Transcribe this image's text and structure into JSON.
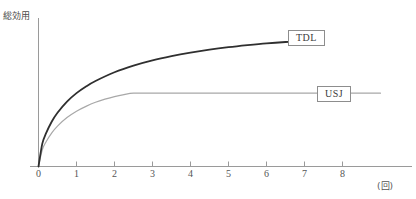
{
  "chart_data": {
    "type": "line",
    "title": "",
    "subtitle": "",
    "xlabel": "(回)",
    "ylabel": "総効用",
    "xlim": [
      -0.35,
      9.2
    ],
    "ylim": [
      0,
      1.12
    ],
    "grid": false,
    "legend_position": "inline-right",
    "x_ticks": [
      "0",
      "1",
      "2",
      "3",
      "4",
      "5",
      "6",
      "7",
      "8"
    ],
    "x_tick_values": [
      0,
      1,
      2,
      3,
      4,
      5,
      6,
      7,
      8
    ],
    "y_ticks": [],
    "series": [
      {
        "name": "TDL",
        "color": "#2f2f2f",
        "width": 1.8,
        "note": "concave increasing curve, still rising at right end",
        "x": [
          0,
          0.1,
          0.2,
          0.35,
          0.5,
          0.75,
          1.0,
          1.25,
          1.5,
          2.0,
          2.5,
          3.0,
          3.5,
          4.0,
          4.5,
          5.0,
          5.5,
          6.0,
          6.5,
          7.0,
          7.4
        ],
        "y": [
          0.0,
          0.175,
          0.255,
          0.345,
          0.412,
          0.497,
          0.562,
          0.613,
          0.655,
          0.722,
          0.773,
          0.813,
          0.845,
          0.872,
          0.895,
          0.914,
          0.93,
          0.944,
          0.954,
          0.961,
          0.965
        ]
      },
      {
        "name": "USJ",
        "color": "#a8a8a8",
        "width": 1.2,
        "note": "concave increasing then flat plateau from about x=2.5",
        "x": [
          0,
          0.1,
          0.2,
          0.35,
          0.5,
          0.75,
          1.0,
          1.25,
          1.5,
          1.75,
          2.0,
          2.25,
          2.5,
          3.0,
          4.0,
          5.0,
          6.0,
          7.0,
          8.0,
          9.0
        ],
        "y": [
          0.0,
          0.128,
          0.19,
          0.258,
          0.31,
          0.375,
          0.424,
          0.461,
          0.492,
          0.516,
          0.536,
          0.551,
          0.562,
          0.562,
          0.562,
          0.562,
          0.562,
          0.562,
          0.562,
          0.562
        ]
      }
    ],
    "annotations": [
      {
        "name": "TDL",
        "kind": "boxed-series-label"
      },
      {
        "name": "USJ",
        "kind": "boxed-series-label"
      }
    ]
  },
  "axes": {
    "y_axis_label": "総効用",
    "x_axis_unit": "(回)",
    "axis_color": "#9a9a9a"
  },
  "labels": {
    "tdl": "TDL",
    "usj": "USJ"
  }
}
